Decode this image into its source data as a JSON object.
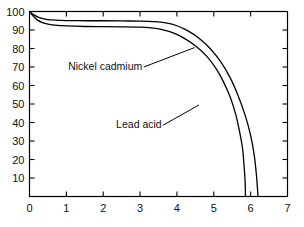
{
  "chart_data": {
    "type": "line",
    "title": "",
    "subtitle": "",
    "xlabel": "",
    "ylabel": "",
    "xlim": [
      0,
      7
    ],
    "ylim": [
      0,
      100
    ],
    "xticks": [
      0,
      1,
      2,
      3,
      4,
      5,
      6,
      7
    ],
    "yticks": [
      0,
      10,
      20,
      30,
      40,
      50,
      60,
      70,
      80,
      90,
      100
    ],
    "xtick_labels": [
      "0",
      "1",
      "2",
      "3",
      "4",
      "5",
      "6",
      "7"
    ],
    "ytick_labels": [
      "",
      "10",
      "20",
      "30",
      "40",
      "50",
      "60",
      "70",
      "80",
      "90",
      "100"
    ],
    "grid": false,
    "legend": "annotations",
    "line_color": "#000000",
    "background_color": "#ffffff",
    "series": [
      {
        "name": "Lead acid",
        "color": "#000000",
        "points": [
          [
            0.0,
            100.0
          ],
          [
            0.1,
            97.5
          ],
          [
            0.2,
            95.6
          ],
          [
            0.35,
            94.0
          ],
          [
            0.5,
            93.2
          ],
          [
            0.75,
            92.5
          ],
          [
            1.0,
            92.2
          ],
          [
            1.5,
            91.9
          ],
          [
            2.0,
            91.8
          ],
          [
            2.5,
            91.7
          ],
          [
            3.0,
            91.5
          ],
          [
            3.3,
            91.1
          ],
          [
            3.6,
            90.2
          ],
          [
            3.9,
            88.4
          ],
          [
            4.2,
            85.5
          ],
          [
            4.5,
            81.5
          ],
          [
            4.8,
            76.0
          ],
          [
            5.05,
            69.5
          ],
          [
            5.25,
            62.5
          ],
          [
            5.45,
            53.5
          ],
          [
            5.6,
            44.0
          ],
          [
            5.7,
            35.0
          ],
          [
            5.78,
            26.0
          ],
          [
            5.82,
            17.0
          ],
          [
            5.85,
            8.0
          ],
          [
            5.86,
            0.0
          ]
        ]
      },
      {
        "name": "Nickel cadmium",
        "color": "#000000",
        "points": [
          [
            0.0,
            100.0
          ],
          [
            0.12,
            98.2
          ],
          [
            0.25,
            96.8
          ],
          [
            0.45,
            95.8
          ],
          [
            0.7,
            95.3
          ],
          [
            1.0,
            95.1
          ],
          [
            1.5,
            95.0
          ],
          [
            2.0,
            95.0
          ],
          [
            2.5,
            94.9
          ],
          [
            3.0,
            94.8
          ],
          [
            3.4,
            94.5
          ],
          [
            3.7,
            93.8
          ],
          [
            4.0,
            92.3
          ],
          [
            4.3,
            89.5
          ],
          [
            4.6,
            85.5
          ],
          [
            4.9,
            80.0
          ],
          [
            5.2,
            72.5
          ],
          [
            5.45,
            64.0
          ],
          [
            5.65,
            55.0
          ],
          [
            5.85,
            44.0
          ],
          [
            6.0,
            33.0
          ],
          [
            6.1,
            22.0
          ],
          [
            6.16,
            11.0
          ],
          [
            6.19,
            3.0
          ],
          [
            6.2,
            0.0
          ]
        ]
      }
    ],
    "annotations": [
      {
        "text": "Nickel cadmium",
        "text_x": 1.05,
        "text_y": 70.5,
        "leader_from_x": 3.1,
        "leader_from_y": 70.0,
        "leader_to_x": 4.48,
        "leader_to_y": 80.5
      },
      {
        "text": "Lead acid",
        "text_x": 2.35,
        "text_y": 39.0,
        "leader_from_x": 3.62,
        "leader_from_y": 38.5,
        "leader_to_x": 4.6,
        "leader_to_y": 49.5
      }
    ]
  }
}
